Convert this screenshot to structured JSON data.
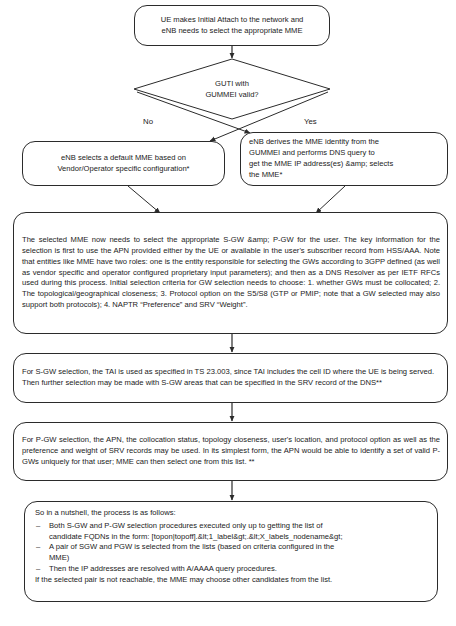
{
  "diagram": {
    "nodes": {
      "start": {
        "type": "terminator",
        "lines": [
          "UE makes Initial Attach to the network and",
          "eNB needs to select the appropriate MME"
        ]
      },
      "decision": {
        "type": "decision",
        "lines": [
          "GUTI with",
          "GUMMEI valid?"
        ],
        "branch_no": "No",
        "branch_yes": "Yes"
      },
      "default_mme": {
        "type": "process",
        "lines": [
          "eNB selects a default MME based on",
          "Vendor/Operator specific  configuration*"
        ]
      },
      "derive_mme": {
        "type": "process",
        "lines": [
          "eNB derives the MME identity from the",
          "GUMMEI and performs DNS query to",
          "get the MME IP address(es) &amp; selects",
          "the MME*"
        ]
      },
      "gw_selection": {
        "type": "process",
        "text": "The selected MME now needs to select the appropriate S-GW &amp; P-GW for the user. The key information for the selection is first to use the APN provided either by the UE or available in the user's subscriber record from HSS/AAA. Note that entities like MME have two roles: one is the entity responsible for selecting the GWs according to 3GPP defined (as well as vendor specific and operator configured proprietary input parameters); and then as a DNS Resolver as per IETF RFCs used during this process. Initial selection criteria for GW selection needs to choose: 1. whether GWs must be collocated; 2. The topological/geographical closeness; 3. Protocol option on the S5/S8 (GTP or PMIP; note that a GW selected may also support both protocols); 4. NAPTR “Preference” and SRV “Weight”."
      },
      "sgw_selection": {
        "type": "process",
        "text": "For S-GW selection, the TAI is used as specified in TS 23.003, since TAI includes the cell ID where the UE is being served. Then further selection may be made with S-GW areas that can be specified in the SRV record of the DNS**"
      },
      "pgw_selection": {
        "type": "process",
        "text": "For P-GW selection, the APN, the collocation status, topology closeness, user's location, and protocol option as well as the preference and weight of SRV records may be used. In its simplest form, the APN would be able to identify a set of valid P-GWs uniquely for that user; MME can then select one from this list. **"
      },
      "summary": {
        "type": "process",
        "intro": "So in a nutshell, the process is as follows:",
        "bullets": [
          {
            "dash": "–",
            "lines": [
              "Both S-GW and P-GW selection procedures executed only up to getting the list of",
              "candidate FQDNs in the form: [topon|topoff].&lt;1_label&gt;.&lt;X_labels_nodename&gt;"
            ]
          },
          {
            "dash": "–",
            "lines": [
              "A pair of SGW and PGW is selected from the lists (based on criteria configured in the",
              "MME)"
            ]
          },
          {
            "dash": "–",
            "lines": [
              "Then the IP addresses are resolved with A/AAAA query procedures."
            ]
          }
        ],
        "trailing_line": "If the selected pair is not reachable, the MME may choose other candidates from the list."
      }
    },
    "caption": "",
    "colors": {
      "stroke": "#2b2b2b",
      "text": "#1b1b1b",
      "background": "#ffffff"
    }
  }
}
